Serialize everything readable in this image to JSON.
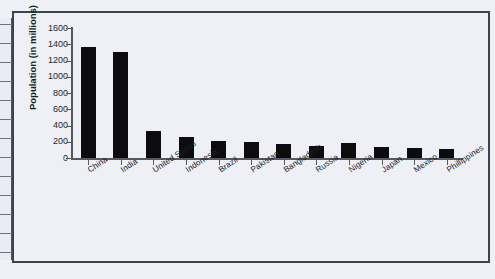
{
  "chart_data": {
    "type": "bar",
    "title": "",
    "subtitle": "",
    "xlabel": "",
    "ylabel": "Population (in millions)",
    "ylim": [
      0,
      1600
    ],
    "ytick_step": 200,
    "yticks": [
      1600,
      1400,
      1200,
      1000,
      800,
      600,
      400,
      200,
      0
    ],
    "grid": false,
    "legend": false,
    "bar_color": "#0c0c0f",
    "categories": [
      "China",
      "India",
      "United States",
      "Indonesia",
      "Brazil",
      "Pakistan",
      "Bangladesh",
      "Russia",
      "Nigeria",
      "Japan",
      "Mexico",
      "Phillippines"
    ],
    "values": [
      1370,
      1300,
      330,
      260,
      210,
      197,
      170,
      145,
      190,
      130,
      128,
      110
    ],
    "series": [
      {
        "name": "Population (in millions)",
        "values": [
          1370,
          1300,
          330,
          260,
          210,
          197,
          170,
          145,
          190,
          130,
          128,
          110
        ]
      }
    ]
  },
  "figure": {
    "frame_color": "#3c424e",
    "background": "#eef0f5",
    "axis_color": "#54595f"
  }
}
